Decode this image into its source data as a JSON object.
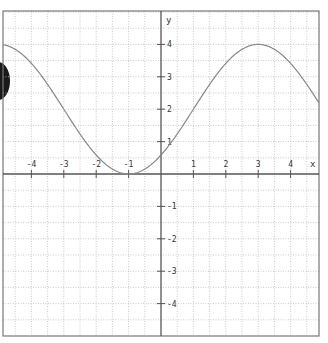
{
  "chart_data": {
    "type": "line",
    "title": "",
    "xlabel": "x",
    "ylabel": "y",
    "xlim": [
      -4.95,
      4.85
    ],
    "ylim": [
      -5.0,
      5.0
    ],
    "grid": true,
    "grid_step": 0.5,
    "x_ticks": [
      -4,
      -3,
      -2,
      -1,
      1,
      2,
      3,
      4
    ],
    "x_tick_labels": [
      "-4",
      "-3",
      "-2",
      "-1",
      "1",
      "2",
      "3",
      "4"
    ],
    "y_ticks": [
      -4,
      -3,
      -2,
      -1,
      1,
      2,
      3,
      4
    ],
    "y_tick_labels": [
      "-4",
      "-3",
      "-2",
      "-1",
      "1",
      "2",
      "3",
      "4"
    ],
    "series": [
      {
        "name": "y = 2 + 2·sin(π(x−1)/4)",
        "x": [
          -5,
          -4.5,
          -4,
          -3.5,
          -3,
          -2.5,
          -2,
          -1.5,
          -1,
          -0.5,
          0,
          0.5,
          1,
          1.5,
          2,
          2.5,
          3,
          3.5,
          4,
          4.5,
          5
        ],
        "values": [
          4.0,
          3.85,
          3.41,
          2.77,
          2.0,
          1.23,
          0.59,
          0.15,
          0.0,
          0.15,
          0.59,
          1.23,
          2.0,
          2.77,
          3.41,
          3.85,
          4.0,
          3.85,
          3.41,
          2.77,
          2.0
        ]
      }
    ],
    "colors": {
      "curve": "#888888",
      "axis": "#555555",
      "grid": "#bdbdbd",
      "frame": "#777777",
      "text": "#333333"
    }
  }
}
